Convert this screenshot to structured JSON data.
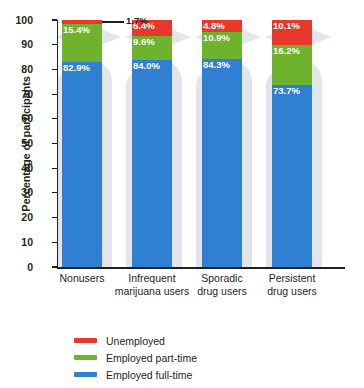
{
  "chart_data": {
    "type": "bar",
    "subtype": "stacked-percentage",
    "title": "",
    "subtitle": "",
    "xlabel": "",
    "ylabel": "Percentage of participants",
    "ylim": [
      0,
      100
    ],
    "yticks": [
      0,
      10,
      20,
      30,
      40,
      50,
      60,
      70,
      80,
      90,
      100
    ],
    "ytick_labels": [
      "0",
      "10",
      "20",
      "30",
      "40",
      "50",
      "60",
      "70",
      "80",
      "90",
      "100"
    ],
    "grid": false,
    "legend_position": "bottom-left",
    "categories": [
      "Nonusers",
      "Infrequent marijuana users",
      "Sporadic drug users",
      "Persistent drug users"
    ],
    "category_lines": [
      [
        "Nonusers",
        ""
      ],
      [
        "Infrequent",
        "marijuana users"
      ],
      [
        "Sporadic",
        "drug users"
      ],
      [
        "Persistent",
        "drug users"
      ]
    ],
    "series": [
      {
        "name": "Employed full-time",
        "color": "#2f7fd2",
        "values": [
          82.9,
          84.0,
          84.3,
          73.7
        ],
        "labels": [
          "82.9%",
          "84.0%",
          "84.3%",
          "73.7%"
        ]
      },
      {
        "name": "Employed part-time",
        "color": "#6eb22d",
        "values": [
          15.4,
          9.6,
          10.9,
          16.2
        ],
        "labels": [
          "15.4%",
          "9.6%",
          "10.9%",
          "16.2%"
        ]
      },
      {
        "name": "Unemployed",
        "color": "#e8382c",
        "values": [
          1.7,
          6.4,
          4.8,
          10.1
        ],
        "labels": [
          "1.7%",
          "6.4%",
          "4.8%",
          "10.1%"
        ]
      }
    ],
    "annotations": [
      {
        "text": "1.7%",
        "for_category": "Nonusers",
        "for_series": "Unemployed",
        "style": "leader-line-callout"
      }
    ]
  },
  "legend": {
    "items": [
      {
        "label": "Unemployed",
        "color": "#e8382c"
      },
      {
        "label": "Employed part-time",
        "color": "#6eb22d"
      },
      {
        "label": "Employed full-time",
        "color": "#2f7fd2"
      }
    ]
  },
  "background": {
    "watermark": "graduate-silhouette",
    "watermark_color": "#e2e4ea"
  }
}
